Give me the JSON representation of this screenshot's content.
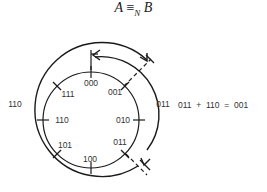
{
  "title": {
    "left": "A",
    "op": "≡",
    "sub": "N",
    "right": "B"
  },
  "inner_ring": {
    "labels": [
      "000",
      "001",
      "010",
      "011",
      "100",
      "101",
      "110",
      "111"
    ]
  },
  "outer_labels": {
    "left": "110",
    "right": "011"
  },
  "equation": "011  +  110  =  001",
  "colors": {
    "stroke": "#1a1a1a",
    "text": "#333333"
  }
}
